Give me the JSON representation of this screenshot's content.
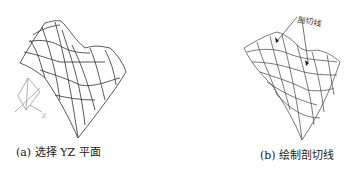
{
  "panels": [
    {
      "id": "a",
      "caption": "(a) 选择 YZ 平面",
      "content": "wireframe-saddle-surface with axis triad",
      "axis_label": "Z"
    },
    {
      "id": "b",
      "caption": "(b) 绘制剖切线",
      "content": "wireframe-saddle-surface with section lines",
      "callout_label": "剖切线"
    }
  ],
  "colors": {
    "stroke": "#444444",
    "triad": "#999999",
    "text": "#222222",
    "background": "#ffffff"
  }
}
